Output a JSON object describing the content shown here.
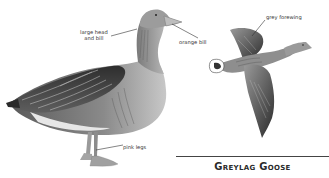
{
  "illustration": {
    "subject": "Greylag Goose",
    "standing_goose": {
      "labels": [
        {
          "id": "head",
          "text_line1": "large head",
          "text_line2": "and bill"
        },
        {
          "id": "bill",
          "text": "orange bill"
        },
        {
          "id": "legs",
          "text": "pink legs"
        }
      ]
    },
    "flying_goose": {
      "labels": [
        {
          "id": "forewing",
          "text": "grey forewing"
        }
      ]
    }
  },
  "title": "Greylag Goose"
}
